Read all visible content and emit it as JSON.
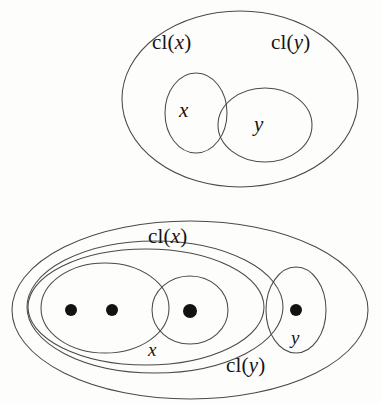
{
  "figure": {
    "title": "",
    "background_color": "#fdfdfc",
    "stroke_color": "#4a4a4a",
    "point_color": "#121212",
    "width": 381,
    "height": 403
  },
  "diagrams": [
    {
      "id": "top-diagram",
      "caption": "",
      "labels": {
        "outer_left": "cl(",
        "outer_left_var": "x",
        "outer_left_close": ")",
        "outer_right": "cl(",
        "outer_right_var": "y",
        "outer_right_close": ")",
        "inner_left": "x",
        "inner_right": "y"
      },
      "shapes": [
        {
          "name": "universe-ellipse",
          "cx": 240,
          "cy": 99,
          "rx": 118,
          "ry": 88
        },
        {
          "name": "x-circle",
          "cx": 196,
          "cy": 113,
          "rx": 31,
          "ry": 40
        },
        {
          "name": "y-ellipse",
          "cx": 265,
          "cy": 125,
          "rx": 47,
          "ry": 37
        }
      ],
      "points": []
    },
    {
      "id": "bottom-diagram",
      "caption": "",
      "labels": {
        "cl_x": "cl(",
        "cl_x_var": "x",
        "cl_x_close": ")",
        "cl_y": "cl(",
        "cl_y_var": "y",
        "cl_y_close": ")",
        "x": "x",
        "y": "y"
      },
      "shapes": [
        {
          "name": "cl-x-outer-ellipse",
          "cx": 190,
          "cy": 310,
          "rx": 178,
          "ry": 89
        },
        {
          "name": "cl-y-ellipse",
          "cx": 155,
          "cy": 307,
          "rx": 128,
          "ry": 66
        },
        {
          "name": "x-ellipse",
          "cx": 146,
          "cy": 307,
          "rx": 118,
          "ry": 58
        },
        {
          "name": "x-inner-left-ellipse",
          "cx": 105,
          "cy": 308,
          "rx": 64,
          "ry": 45
        },
        {
          "name": "middle-singleton-ellipse",
          "cx": 190,
          "cy": 310,
          "rx": 38,
          "ry": 34
        },
        {
          "name": "y-ellipse",
          "cx": 296,
          "cy": 310,
          "rx": 30,
          "ry": 43
        }
      ],
      "points": [
        {
          "name": "point-1",
          "cx": 71,
          "cy": 310,
          "r": 6
        },
        {
          "name": "point-2",
          "cx": 112,
          "cy": 310,
          "r": 6
        },
        {
          "name": "point-3",
          "cx": 190,
          "cy": 311,
          "r": 7
        },
        {
          "name": "point-4",
          "cx": 296,
          "cy": 310,
          "r": 6
        }
      ]
    }
  ]
}
